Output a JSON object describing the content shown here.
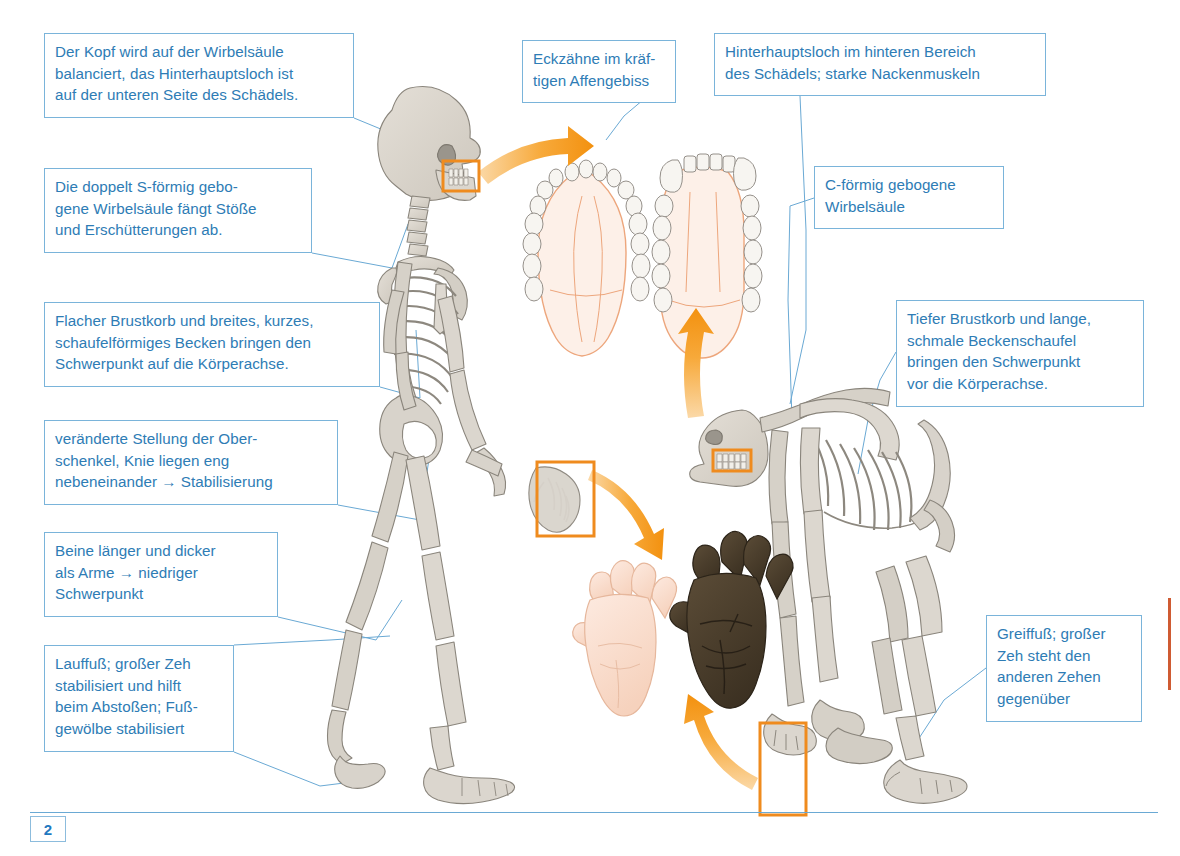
{
  "page": {
    "number": "2"
  },
  "colors": {
    "callout_border": "#7ab4da",
    "callout_text": "#2e7cb5",
    "highlight_box": "#ef8b1e",
    "arrow": "#f59b23",
    "bone_fill": "#d8d3cb",
    "bone_stroke": "#8a857c",
    "ape_hand": "#4a3d2c",
    "human_hand": "#f7d9c8",
    "palate": "#f0a882",
    "rule": "#6aa9d4"
  },
  "callouts": [
    {
      "id": "head-balance",
      "text": "Der Kopf wird auf der Wirbelsäule\nbalanciert, das Hinterhauptsloch ist\nauf der unteren Seite des Schädels.",
      "x": 44,
      "y": 33,
      "w": 310,
      "h": 85
    },
    {
      "id": "s-shaped-spine",
      "text": "Die doppelt S-förmig gebo-\ngene Wirbelsäule fängt Stöße\nund Erschütterungen ab.",
      "x": 44,
      "y": 168,
      "w": 268,
      "h": 85
    },
    {
      "id": "flat-ribcage-pelvis",
      "text": "Flacher Brustkorb und breites, kurzes,\nschaufelförmiges Becken bringen den\nSchwerpunkt auf die Körperachse.",
      "x": 44,
      "y": 302,
      "w": 336,
      "h": 85
    },
    {
      "id": "thigh-position",
      "text": "veränderte Stellung der Ober-\nschenkel, Knie liegen eng\nnebeneinander → Stabilisierung",
      "x": 44,
      "y": 420,
      "w": 294,
      "h": 85
    },
    {
      "id": "legs-longer",
      "text": "Beine länger und dicker\nals Arme → niedriger\nSchwerpunkt",
      "x": 44,
      "y": 532,
      "w": 234,
      "h": 85
    },
    {
      "id": "walking-foot",
      "text": "Lauffuß; großer Zeh\nstabilisiert und hilft\nbeim Abstoßen; Fuß-\ngewölbe stabilisiert",
      "x": 44,
      "y": 645,
      "w": 190,
      "h": 107
    },
    {
      "id": "canine-teeth",
      "text": "Eckzähne im kräf-\ntigen Affengebiss",
      "x": 522,
      "y": 40,
      "w": 154,
      "h": 63
    },
    {
      "id": "foramen-magnum-rear",
      "text": "Hinterhauptsloch im hinteren Bereich\ndes Schädels; starke Nackenmuskeln",
      "x": 714,
      "y": 33,
      "w": 332,
      "h": 63
    },
    {
      "id": "c-shaped-spine",
      "text": "C-förmig gebogene\nWirbelsäule",
      "x": 814,
      "y": 166,
      "w": 190,
      "h": 63
    },
    {
      "id": "deep-ribcage",
      "text": "Tiefer Brustkorb und lange,\nschmale Beckenschaufel\nbringen den Schwerpunkt\nvor die Körperachse.",
      "x": 896,
      "y": 300,
      "w": 248,
      "h": 107
    },
    {
      "id": "grasping-foot",
      "text": "Greiffuß; großer\nZeh steht den\nanderen Zehen\ngegenüber",
      "x": 986,
      "y": 615,
      "w": 156,
      "h": 107
    }
  ],
  "highlight_boxes": [
    {
      "id": "human-teeth-highlight",
      "x": 443,
      "y": 161,
      "w": 36,
      "h": 30
    },
    {
      "id": "human-hand-highlight",
      "x": 537,
      "y": 462,
      "w": 57,
      "h": 74
    },
    {
      "id": "ape-teeth-highlight",
      "x": 713,
      "y": 450,
      "w": 38,
      "h": 21
    },
    {
      "id": "ape-foot-highlight",
      "x": 760,
      "y": 723,
      "w": 46,
      "h": 92
    }
  ],
  "figures": [
    {
      "id": "human-skeleton",
      "label": "Menschenskelett, aufrechter Gang"
    },
    {
      "id": "ape-skeleton",
      "label": "Menschenaffenskelett, Knöchelgang"
    },
    {
      "id": "human-palate",
      "label": "Gebiss Mensch, parabelförmiger Zahnbogen"
    },
    {
      "id": "ape-palate",
      "label": "Gebiss Menschenaffe, U-förmiger Zahnbogen mit Eckzähnen"
    },
    {
      "id": "human-hand",
      "label": "Hand des Menschen"
    },
    {
      "id": "ape-hand",
      "label": "Hand des Menschenaffen"
    }
  ],
  "arrows": [
    {
      "id": "arrow-to-palates",
      "from": "human-teeth-highlight",
      "to": "human-palate"
    },
    {
      "id": "arrow-to-hands",
      "from": "human-hand-highlight",
      "to": "human-hand"
    },
    {
      "id": "arrow-ape-teeth-up",
      "from": "ape-teeth-highlight",
      "to": "ape-palate"
    },
    {
      "id": "arrow-ape-foot-up",
      "from": "ape-foot-highlight",
      "to": "ape-hand"
    }
  ]
}
